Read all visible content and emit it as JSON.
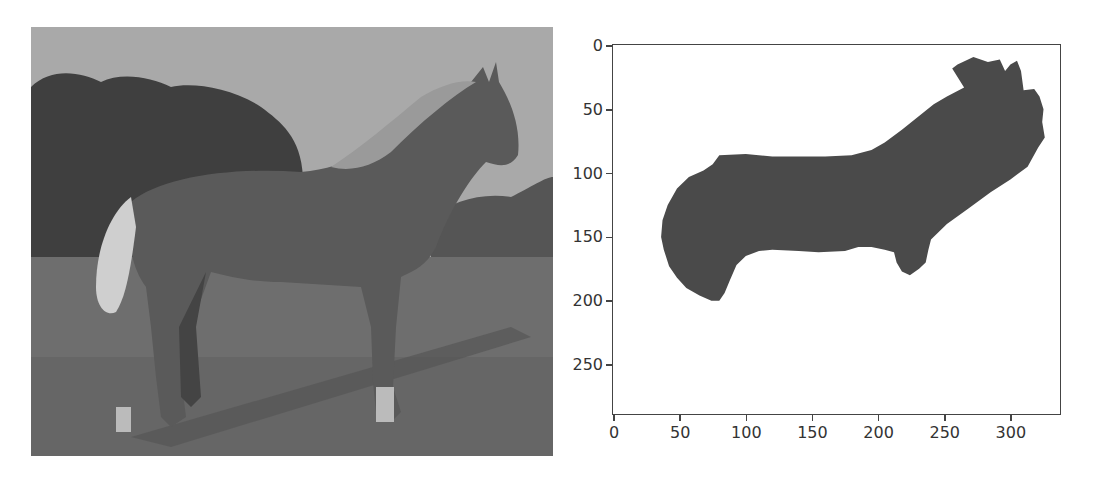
{
  "left_panel": {
    "content": "grayscale photograph of a horse standing on grass with trees in background",
    "icon": "horse-photo"
  },
  "chart_data": {
    "type": "heatmap",
    "title": "",
    "xlabel": "",
    "ylabel": "",
    "xlim": [
      0,
      330
    ],
    "ylim": [
      290,
      0
    ],
    "x_ticks": [
      0,
      50,
      100,
      150,
      200,
      250,
      300
    ],
    "y_ticks": [
      0,
      50,
      100,
      150,
      200,
      250
    ],
    "x_tick_labels": [
      "0",
      "50",
      "100",
      "150",
      "200",
      "250",
      "300"
    ],
    "y_tick_labels": [
      "0",
      "50",
      "100",
      "150",
      "200",
      "250"
    ],
    "grid": false,
    "mask_color": "#4a4a4a",
    "background_color": "#ffffff",
    "mask_outline_points": [
      [
        260,
        15
      ],
      [
        272,
        9
      ],
      [
        283,
        13
      ],
      [
        292,
        11
      ],
      [
        296,
        20
      ],
      [
        300,
        15
      ],
      [
        305,
        12
      ],
      [
        308,
        20
      ],
      [
        310,
        35
      ],
      [
        318,
        34
      ],
      [
        322,
        40
      ],
      [
        325,
        50
      ],
      [
        324,
        60
      ],
      [
        326,
        72
      ],
      [
        321,
        80
      ],
      [
        313,
        95
      ],
      [
        300,
        105
      ],
      [
        285,
        115
      ],
      [
        268,
        128
      ],
      [
        252,
        140
      ],
      [
        240,
        152
      ],
      [
        238,
        160
      ],
      [
        236,
        170
      ],
      [
        231,
        175
      ],
      [
        224,
        180
      ],
      [
        218,
        177
      ],
      [
        214,
        170
      ],
      [
        212,
        162
      ],
      [
        205,
        160
      ],
      [
        195,
        158
      ],
      [
        185,
        158
      ],
      [
        175,
        161
      ],
      [
        155,
        162
      ],
      [
        140,
        161
      ],
      [
        120,
        160
      ],
      [
        110,
        161
      ],
      [
        100,
        165
      ],
      [
        93,
        172
      ],
      [
        88,
        184
      ],
      [
        84,
        194
      ],
      [
        80,
        200
      ],
      [
        74,
        200
      ],
      [
        65,
        196
      ],
      [
        55,
        190
      ],
      [
        48,
        182
      ],
      [
        42,
        173
      ],
      [
        38,
        160
      ],
      [
        36,
        150
      ],
      [
        37,
        137
      ],
      [
        41,
        125
      ],
      [
        48,
        112
      ],
      [
        57,
        103
      ],
      [
        68,
        98
      ],
      [
        75,
        93
      ],
      [
        80,
        86
      ],
      [
        100,
        85
      ],
      [
        120,
        87
      ],
      [
        160,
        87
      ],
      [
        180,
        86
      ],
      [
        195,
        82
      ],
      [
        205,
        76
      ],
      [
        218,
        66
      ],
      [
        230,
        56
      ],
      [
        242,
        46
      ],
      [
        252,
        40
      ],
      [
        265,
        33
      ],
      [
        256,
        18
      ]
    ]
  }
}
